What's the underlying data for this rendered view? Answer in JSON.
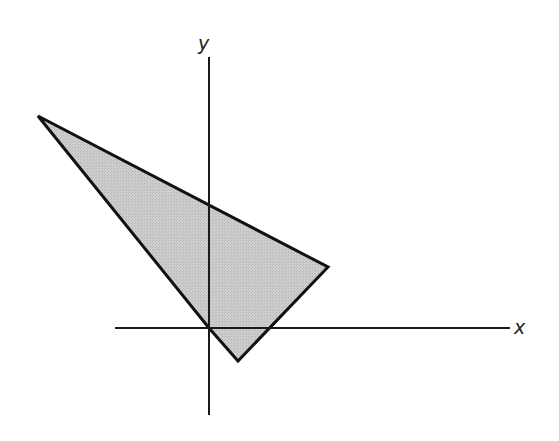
{
  "diagram": {
    "type": "coordinate-plane-polygon",
    "axes": {
      "x": {
        "label": "x",
        "from": [
          115,
          328
        ],
        "to": [
          510,
          328
        ]
      },
      "y": {
        "label": "y",
        "from": [
          209,
          57
        ],
        "to": [
          209,
          415
        ]
      },
      "origin": [
        209,
        328
      ]
    },
    "polygon": {
      "vertices": [
        [
          38,
          116
        ],
        [
          328,
          267
        ],
        [
          238,
          361
        ],
        [
          209,
          328
        ]
      ],
      "fill": "#c8c8c8",
      "stroke": "#111111"
    },
    "colors": {
      "background": "#ffffff",
      "axis": "#1a1a1a",
      "label": "#222222"
    }
  }
}
